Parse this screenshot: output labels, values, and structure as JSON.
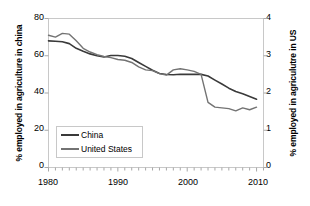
{
  "chart_data": {
    "type": "line",
    "title": "",
    "xlabel": "",
    "ylabel": "% employed in agriculture in china",
    "ylabel_right": "% employed in agriculutre in US",
    "xlim": [
      1980,
      2011
    ],
    "ylim": [
      0,
      80
    ],
    "ylim_right": [
      0,
      4
    ],
    "grid": false,
    "legend_position": "lower-left",
    "xticks": [
      "1980",
      "1990",
      "2000",
      "2010"
    ],
    "xtick_values": [
      1980,
      1990,
      2000,
      2010
    ],
    "yticks_left": [
      "0",
      "20",
      "40",
      "60",
      "80"
    ],
    "ytick_values_left": [
      0,
      20,
      40,
      60,
      80
    ],
    "yticks_right": [
      "0",
      "1",
      "2",
      "3",
      "4"
    ],
    "ytick_values_right": [
      0,
      1,
      2,
      3,
      4
    ],
    "minor_tick_interval": 1,
    "x": [
      1980,
      1981,
      1982,
      1983,
      1984,
      1985,
      1986,
      1987,
      1988,
      1989,
      1990,
      1991,
      1992,
      1993,
      1994,
      1995,
      1996,
      1997,
      1998,
      1999,
      2000,
      2001,
      2002,
      2003,
      2004,
      2005,
      2006,
      2007,
      2008,
      2009,
      2010
    ],
    "series": [
      {
        "name": "China",
        "axis": "left",
        "color": "#3a3a3a",
        "values": [
          68.0,
          67.8,
          67.5,
          66.5,
          64.0,
          62.4,
          61.0,
          60.0,
          59.3,
          60.1,
          60.1,
          59.7,
          58.5,
          56.4,
          54.3,
          52.2,
          50.5,
          49.9,
          49.8,
          50.1,
          50.0,
          50.0,
          50.0,
          49.1,
          46.9,
          44.8,
          42.6,
          40.8,
          39.6,
          38.1,
          36.7
        ]
      },
      {
        "name": "United States",
        "axis": "right",
        "color": "#737373",
        "values": [
          3.55,
          3.5,
          3.6,
          3.58,
          3.4,
          3.2,
          3.1,
          3.03,
          2.98,
          2.95,
          2.9,
          2.88,
          2.82,
          2.7,
          2.62,
          2.6,
          2.52,
          2.48,
          2.62,
          2.65,
          2.62,
          2.58,
          2.5,
          1.75,
          1.62,
          1.6,
          1.58,
          1.52,
          1.6,
          1.55,
          1.62
        ]
      }
    ],
    "legend": [
      {
        "label": "China",
        "color": "#3a3a3a"
      },
      {
        "label": "United States",
        "color": "#737373"
      }
    ]
  },
  "style": {
    "frame_color": "#c8c8c8",
    "axis_color": "#a8a8a8",
    "text_color": "#000000",
    "background": "#ffffff"
  }
}
